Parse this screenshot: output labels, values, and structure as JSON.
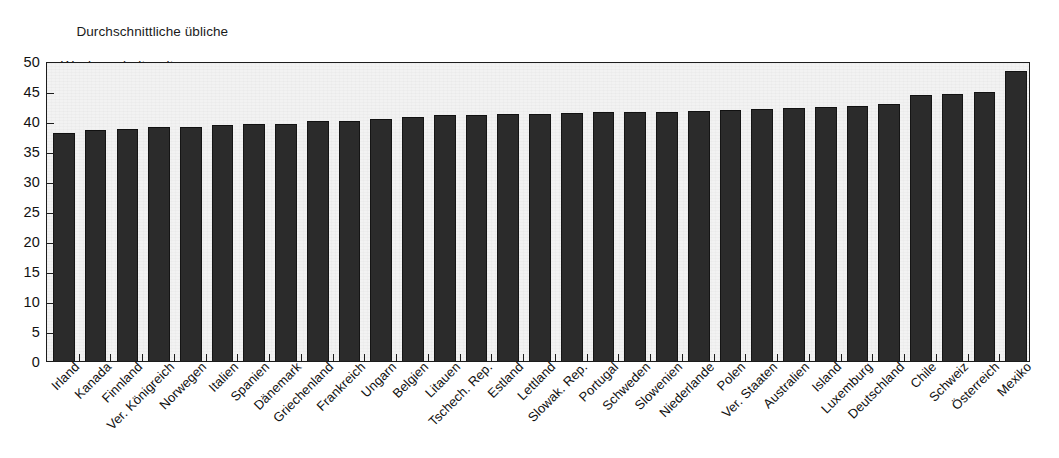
{
  "title": {
    "line1": "Durchschnittliche übliche",
    "line2": "Wochenarbeitszeit"
  },
  "axis": {
    "y_ticks": [
      "50",
      "45",
      "40",
      "35",
      "30",
      "25",
      "20",
      "15",
      "10",
      "5",
      "0"
    ]
  },
  "colors": {
    "bar": "#2b2b2b",
    "plot_background": "#f2f2f2",
    "axis": "#1c1c1c",
    "text": "#111111"
  },
  "chart_data": {
    "type": "bar",
    "title": "Durchschnittliche übliche Wochenarbeitszeit",
    "xlabel": "",
    "ylabel": "",
    "ylim": [
      0,
      50
    ],
    "ytick_step": 5,
    "grid": false,
    "legend": false,
    "orientation": "vertical",
    "sorted": "ascending",
    "categories": [
      "Irland",
      "Kanada",
      "Finnland",
      "Ver. Königreich",
      "Norwegen",
      "Italien",
      "Spanien",
      "Dänemark",
      "Griechenland",
      "Frankreich",
      "Ungarn",
      "Belgien",
      "Litauen",
      "Tschech. Rep.",
      "Estland",
      "Lettland",
      "Slowak. Rep.",
      "Portugal",
      "Schweden",
      "Slowenien",
      "Niederlande",
      "Polen",
      "Ver. Staaten",
      "Australien",
      "Island",
      "Luxemburg",
      "Deutschland",
      "Chile",
      "Schweiz",
      "Österreich",
      "Mexiko"
    ],
    "values": [
      37.9,
      38.4,
      38.5,
      38.8,
      38.9,
      39.2,
      39.3,
      39.4,
      39.8,
      39.9,
      40.2,
      40.5,
      40.8,
      40.9,
      41.0,
      41.0,
      41.1,
      41.3,
      41.4,
      41.4,
      41.5,
      41.7,
      41.9,
      42.0,
      42.1,
      42.3,
      42.6,
      44.2,
      44.4,
      44.7,
      48.2
    ]
  }
}
